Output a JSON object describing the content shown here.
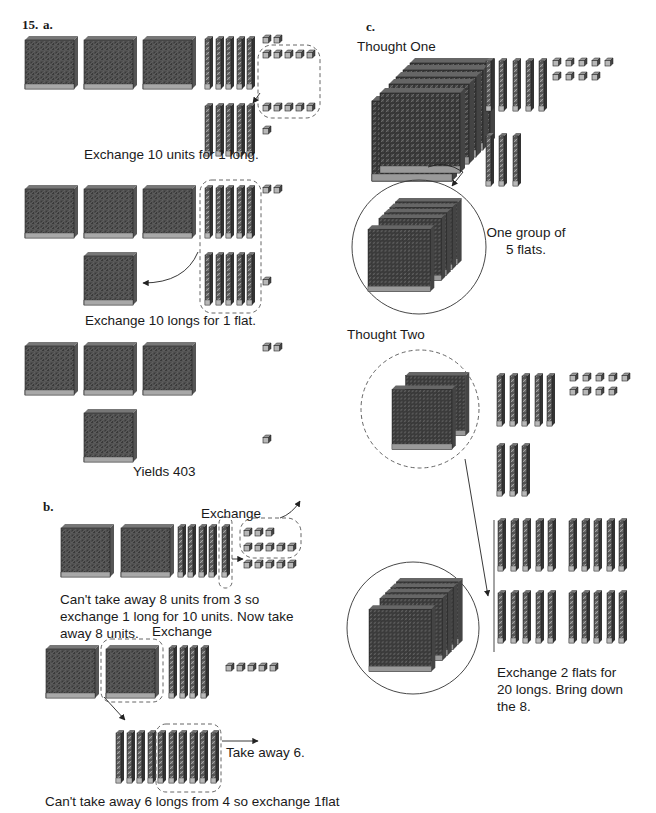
{
  "problem_number": "15.",
  "parts": {
    "a": {
      "label": "a.",
      "steps": [
        {
          "caption": "Exchange 10 units for 1 long.",
          "flats": 3,
          "longs": 10,
          "units": 13,
          "note": "10 units circled, exchanged for 1 long"
        },
        {
          "caption": "Exchange 10 longs for 1 flat.",
          "flats": 3,
          "longs": 10,
          "units": 3,
          "note": "10 longs circled, exchanged for 1 flat"
        },
        {
          "caption": "Yields 403",
          "flats": 4,
          "longs": 0,
          "units": 3
        }
      ]
    },
    "b": {
      "label": "b.",
      "steps": [
        {
          "annotation": "Exchange",
          "caption": "Can't take away 8 units from 3 so exchange 1 long for 10 units. Now take away 8 units.",
          "flats": 2,
          "longs": 5,
          "units": 13
        },
        {
          "annotation": "Exchange",
          "caption": "Can't take away 6 longs from 4 so exchange 1flat",
          "side_note": "Take away 6.",
          "flats": 2,
          "longs": 4,
          "units": 5,
          "exchanged_longs": 10
        }
      ]
    },
    "c": {
      "label": "c.",
      "thought_one": {
        "title": "Thought One",
        "note": "One group of 5 flats.",
        "flats": 5,
        "longs": 8,
        "units": 9
      },
      "thought_two": {
        "title": "Thought Two",
        "caption": "Exchange 2 flats for 20 longs. Bring down the 8.",
        "flats": 2,
        "longs": 8,
        "units": 9,
        "exchanged_longs": 20,
        "remaining_flats": 5
      }
    }
  },
  "colors": {
    "flat_dark": "#3a3a3a",
    "cube_face": "#b8b8b8",
    "outline": "#222222",
    "dashed": "#555555",
    "background": "#ffffff"
  }
}
